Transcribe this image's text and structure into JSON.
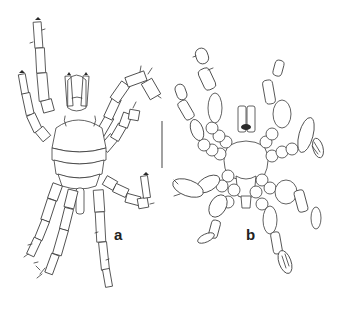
{
  "figure": {
    "panels": [
      {
        "label": "a",
        "view": "dorsal"
      },
      {
        "label": "b",
        "view": "ventral"
      }
    ],
    "scale_bar": {
      "orientation": "vertical"
    }
  }
}
